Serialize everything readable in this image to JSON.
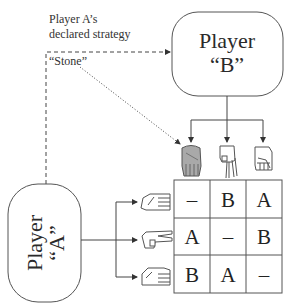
{
  "annotation": {
    "line1": "Player A’s",
    "line2": "declared strategy",
    "line3": "“Stone”"
  },
  "player_b": {
    "line1": "Player",
    "line2": "“B”"
  },
  "player_a": {
    "line1": "Player",
    "line2": "“A”"
  },
  "columns": [
    {
      "hand": "paper",
      "highlighted": true
    },
    {
      "hand": "scissors",
      "highlighted": false
    },
    {
      "hand": "stone",
      "highlighted": false
    }
  ],
  "rows": [
    {
      "hand": "paper"
    },
    {
      "hand": "scissors"
    },
    {
      "hand": "stone"
    }
  ],
  "matrix": [
    [
      "–",
      "B",
      "A"
    ],
    [
      "A",
      "–",
      "B"
    ],
    [
      "B",
      "A",
      "–"
    ]
  ],
  "colors": {
    "highlight": "#a9a9a9",
    "line": "#444444"
  }
}
